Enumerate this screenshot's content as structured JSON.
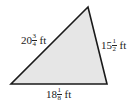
{
  "diagram": {
    "shape": "triangle",
    "fill_color": "#e6e6e6",
    "stroke_color": "#1a1a1a",
    "vertices": {
      "top": [
        88,
        7
      ],
      "bottom_left": [
        11,
        84
      ],
      "bottom_right": [
        107,
        84
      ]
    },
    "sides": {
      "left": {
        "whole": "20",
        "numerator": "3",
        "denominator": "4",
        "unit": "ft"
      },
      "right": {
        "whole": "15",
        "numerator": "1",
        "denominator": "2",
        "unit": "ft"
      },
      "bottom": {
        "whole": "18",
        "numerator": "1",
        "denominator": "8",
        "unit": "ft"
      }
    }
  }
}
